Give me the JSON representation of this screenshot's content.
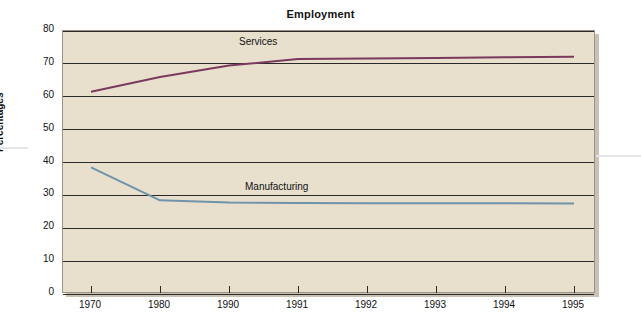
{
  "chart_data": {
    "type": "line",
    "title": "Employment",
    "xlabel": "",
    "ylabel": "Percentages",
    "categories": [
      "1970",
      "1980",
      "1990",
      "1991",
      "1992",
      "1993",
      "1994",
      "1995"
    ],
    "yticks": [
      0,
      10,
      20,
      30,
      40,
      50,
      60,
      70,
      80
    ],
    "ylim": [
      0,
      80
    ],
    "grid": true,
    "legend": "inline-labels",
    "series": [
      {
        "name": "Services",
        "color": "#7a3a5e",
        "values": [
          61.5,
          66.0,
          69.5,
          71.5,
          71.6,
          71.8,
          72.0,
          72.2
        ]
      },
      {
        "name": "Manufacturing",
        "color": "#6f93aa",
        "values": [
          38.5,
          28.5,
          27.8,
          27.7,
          27.6,
          27.6,
          27.6,
          27.5
        ]
      }
    ],
    "annotations": [
      {
        "text": "Services",
        "series": "Services"
      },
      {
        "text": "Manufacturing",
        "series": "Manufacturing"
      }
    ]
  }
}
